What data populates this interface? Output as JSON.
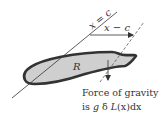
{
  "diagram": {
    "type": "physics-region-gravity",
    "colors": {
      "region_fill": "#cfcfcf",
      "region_stroke": "#333333",
      "line": "#333333",
      "background": "#ffffff"
    },
    "labels": {
      "line_label": "x = c",
      "distance_label": "x − c",
      "region_label": "R",
      "caption_line1": "Force of gravity",
      "caption_line2_prefix": "is ",
      "caption_g": "g",
      "caption_delta": " δ ",
      "caption_L": "L",
      "caption_rest": "(x)dx"
    }
  }
}
